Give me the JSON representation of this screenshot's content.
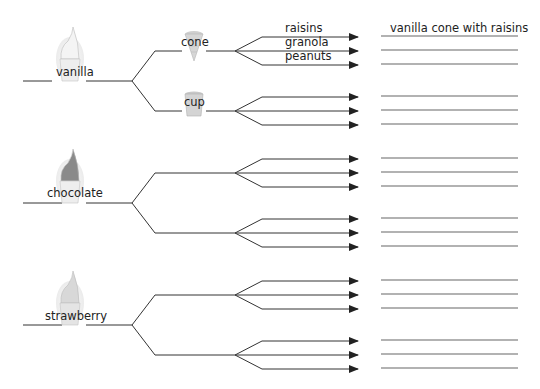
{
  "diagram": {
    "type": "tree-diagram",
    "title": "",
    "colors": {
      "line": "#333333",
      "answer_line": "#555555",
      "text": "#222222"
    },
    "header": {
      "answer_example": "vanilla cone with raisins"
    },
    "toppings_labels": [
      "raisins",
      "granola",
      "peanuts"
    ],
    "flavors": [
      {
        "label": "vanilla",
        "icon": "vanilla-ice-cream-icon",
        "containers": [
          {
            "label": "cone",
            "icon": "cone-icon"
          },
          {
            "label": "cup",
            "icon": "cup-icon"
          }
        ]
      },
      {
        "label": "chocolate",
        "icon": "chocolate-ice-cream-icon",
        "containers": [
          {
            "label": ""
          },
          {
            "label": ""
          }
        ]
      },
      {
        "label": "strawberry",
        "icon": "strawberry-ice-cream-icon",
        "containers": [
          {
            "label": ""
          },
          {
            "label": ""
          }
        ]
      }
    ],
    "answer_lines_count": 18,
    "filled_answers": [
      "vanilla cone with raisins"
    ]
  }
}
